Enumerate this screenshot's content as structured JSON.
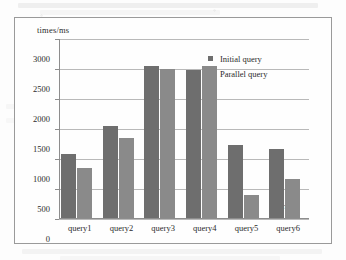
{
  "chart_data": {
    "type": "bar",
    "title": "",
    "xlabel": "queries",
    "ylabel": "times/ms",
    "categories": [
      "query1",
      "query2",
      "query3",
      "query4",
      "query5",
      "query6"
    ],
    "series": [
      {
        "name": "Initial query",
        "values": [
          1070,
          1530,
          2540,
          2475,
          1215,
          1150
        ]
      },
      {
        "name": "Parallel query",
        "values": [
          840,
          1335,
          2480,
          2530,
          385,
          650
        ]
      }
    ],
    "ylim": [
      0,
      3000
    ],
    "yticks": [
      3000,
      2500,
      2000,
      1500,
      1000,
      500,
      0
    ],
    "ytick_labels": [
      "3000",
      "2500",
      "2000",
      "1500",
      "1000",
      "500",
      "0"
    ],
    "grid": true,
    "legend_position": "upper-right",
    "colors": {
      "initial_query": "#6e6e6e",
      "parallel_query": "#8a8a8a",
      "gridline": "#b9b9b9",
      "axis": "#8d8d8d",
      "frame": "#9a9a9a",
      "text": "#2b2b2b",
      "background": "#fefefe"
    }
  },
  "legend": {
    "items": [
      {
        "label": "Initial query"
      },
      {
        "label": "Parallel query"
      }
    ]
  }
}
